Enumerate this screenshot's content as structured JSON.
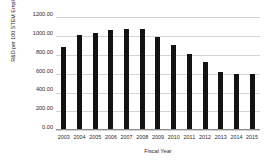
{
  "chart_data": {
    "type": "bar",
    "title": "",
    "xlabel": "Fiscal Year",
    "ylabel": "R&D per 100 STEM Employees - DOD",
    "categories": [
      "2003",
      "2004",
      "2005",
      "2006",
      "2007",
      "2008",
      "2009",
      "2010",
      "2011",
      "2012",
      "2013",
      "2014",
      "2015"
    ],
    "values": [
      890,
      1010,
      1035,
      1070,
      1075,
      1075,
      995,
      905,
      810,
      725,
      615,
      600,
      595
    ],
    "ylim": [
      0,
      1200
    ],
    "ytick_labels": [
      "1200.00",
      "1000.00",
      "800.00",
      "600.00",
      "400.00",
      "200.00",
      "0.00"
    ],
    "ytick_values": [
      1200,
      1000,
      800,
      600,
      400,
      200,
      0
    ],
    "grid": true,
    "legend": "none",
    "bar_color": "#121212",
    "grid_color": "#d4d4d4",
    "text_color": "#2b2b2b",
    "background_color": "#ffffff"
  }
}
